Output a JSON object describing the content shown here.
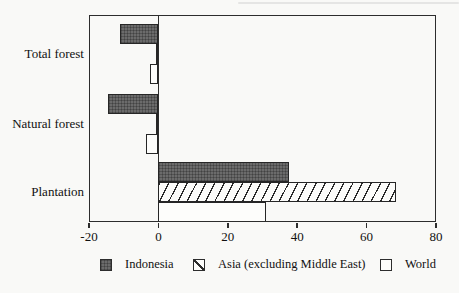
{
  "chart_data": {
    "type": "bar",
    "orientation": "horizontal",
    "title": "",
    "xlabel": "",
    "ylabel": "",
    "xlim": [
      -20,
      80
    ],
    "x_ticks": [
      -20,
      0,
      20,
      40,
      60,
      80
    ],
    "x_tick_labels": [
      "-20",
      "0",
      "20",
      "40",
      "60",
      "80"
    ],
    "categories": [
      "Total forest",
      "Natural forest",
      "Plantation"
    ],
    "series": [
      {
        "name": "Indonesia",
        "pattern": "solid-dark",
        "values": [
          -11.2,
          -14.5,
          37.5
        ]
      },
      {
        "name": "Asia (excluding Middle East)",
        "pattern": "diagonal-hatch",
        "values": [
          -0.7,
          -0.8,
          68.5
        ]
      },
      {
        "name": "World",
        "pattern": "open-white",
        "values": [
          -2.5,
          -3.7,
          31
        ]
      }
    ],
    "legend_position": "bottom",
    "grid": false,
    "zero_line_at": 0
  },
  "colors": {
    "frame": "#2d2d2d",
    "bar_dark_fill": "#6b6b6b",
    "bar_open_fill": "#fdfdfb",
    "text": "#111111",
    "background": "#f9f9f7"
  }
}
